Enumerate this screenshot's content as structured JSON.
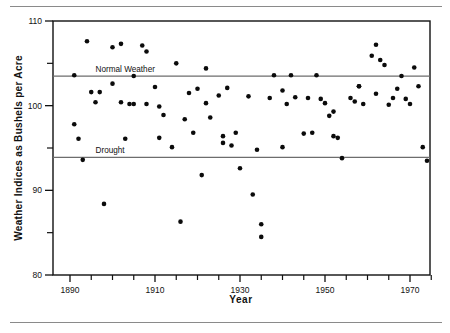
{
  "chart_data": {
    "type": "scatter",
    "title": "",
    "xlabel": "Year",
    "ylabel": "Weather Indices as Bushels per Acre",
    "xlim": [
      1886,
      1977
    ],
    "ylim": [
      80,
      110
    ],
    "xticks": [
      1890,
      1895,
      1900,
      1905,
      1910,
      1915,
      1920,
      1925,
      1930,
      1935,
      1940,
      1945,
      1950,
      1955,
      1960,
      1965,
      1970,
      1975
    ],
    "xtick_labels": [
      "1890",
      "",
      "",
      "",
      "1910",
      "",
      "",
      "",
      "1930",
      "",
      "",
      "",
      "1950",
      "",
      "",
      "",
      "1970",
      ""
    ],
    "yticks": [
      80,
      85,
      90,
      95,
      100,
      105,
      110
    ],
    "ytick_labels": [
      "80",
      "",
      "90",
      "",
      "100",
      "",
      "110"
    ],
    "grid": false,
    "legend": "none",
    "reference_lines": [
      {
        "label": "Normal Weather",
        "value": 103.5,
        "label_x": 1896
      },
      {
        "label": "Drought",
        "value": 93.9,
        "label_x": 1896
      }
    ],
    "series": [
      {
        "name": "Weather Index",
        "marker": "circle",
        "color": "#0b0b0b",
        "points": [
          [
            1891,
            103.6
          ],
          [
            1891,
            97.8
          ],
          [
            1892,
            96.1
          ],
          [
            1893,
            93.6
          ],
          [
            1894,
            107.6
          ],
          [
            1895,
            101.6
          ],
          [
            1896,
            100.4
          ],
          [
            1897,
            101.6
          ],
          [
            1898,
            88.4
          ],
          [
            1900,
            106.9
          ],
          [
            1900,
            102.6
          ],
          [
            1902,
            107.3
          ],
          [
            1902,
            100.4
          ],
          [
            1903,
            96.1
          ],
          [
            1904,
            100.2
          ],
          [
            1905,
            100.2
          ],
          [
            1905,
            103.5
          ],
          [
            1907,
            107.1
          ],
          [
            1908,
            100.2
          ],
          [
            1908,
            106.4
          ],
          [
            1910,
            102.2
          ],
          [
            1911,
            99.9
          ],
          [
            1911,
            96.2
          ],
          [
            1912,
            98.9
          ],
          [
            1914,
            95.1
          ],
          [
            1915,
            105.0
          ],
          [
            1916,
            86.3
          ],
          [
            1917,
            98.4
          ],
          [
            1918,
            101.5
          ],
          [
            1919,
            96.8
          ],
          [
            1920,
            102.0
          ],
          [
            1921,
            91.8
          ],
          [
            1922,
            104.4
          ],
          [
            1922,
            100.3
          ],
          [
            1923,
            98.6
          ],
          [
            1925,
            101.2
          ],
          [
            1926,
            96.4
          ],
          [
            1926,
            95.6
          ],
          [
            1927,
            102.1
          ],
          [
            1928,
            95.3
          ],
          [
            1929,
            96.8
          ],
          [
            1930,
            92.6
          ],
          [
            1932,
            101.1
          ],
          [
            1933,
            89.5
          ],
          [
            1934,
            94.8
          ],
          [
            1935,
            86.0
          ],
          [
            1935,
            84.5
          ],
          [
            1937,
            100.9
          ],
          [
            1938,
            103.6
          ],
          [
            1940,
            95.1
          ],
          [
            1940,
            101.8
          ],
          [
            1941,
            100.2
          ],
          [
            1942,
            103.6
          ],
          [
            1943,
            101.0
          ],
          [
            1945,
            96.7
          ],
          [
            1946,
            100.9
          ],
          [
            1947,
            96.8
          ],
          [
            1948,
            103.6
          ],
          [
            1949,
            100.8
          ],
          [
            1950,
            100.3
          ],
          [
            1951,
            98.8
          ],
          [
            1952,
            99.3
          ],
          [
            1952,
            96.4
          ],
          [
            1953,
            96.2
          ],
          [
            1954,
            93.8
          ],
          [
            1956,
            100.9
          ],
          [
            1957,
            100.5
          ],
          [
            1958,
            102.3
          ],
          [
            1958,
            102.3
          ],
          [
            1959,
            100.2
          ],
          [
            1961,
            105.9
          ],
          [
            1962,
            107.2
          ],
          [
            1962,
            101.4
          ],
          [
            1963,
            105.4
          ],
          [
            1964,
            104.8
          ],
          [
            1965,
            100.1
          ],
          [
            1966,
            100.9
          ],
          [
            1967,
            102.0
          ],
          [
            1968,
            103.5
          ],
          [
            1969,
            100.8
          ],
          [
            1970,
            100.2
          ],
          [
            1971,
            104.5
          ],
          [
            1972,
            102.3
          ],
          [
            1973,
            95.1
          ],
          [
            1974,
            93.5
          ]
        ]
      }
    ]
  }
}
